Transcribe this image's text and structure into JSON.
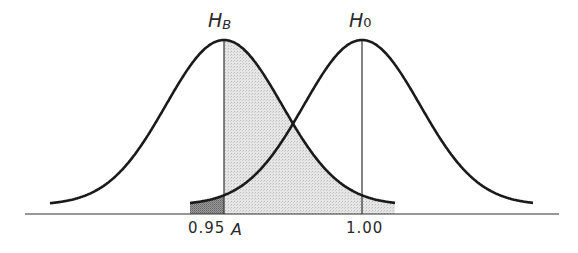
{
  "figure": {
    "labels": {
      "hb_main": "H",
      "hb_sub": "B",
      "h0_main": "H",
      "h0_sub": "0",
      "tick_left": "0.95",
      "tick_a": "A",
      "tick_right": "1.00"
    },
    "colors": {
      "stroke": "#1a1a1a",
      "light_shade": "#dcdcdc",
      "dark_shade": "#8a8a8a",
      "axis": "#333333"
    }
  },
  "chart_data": {
    "type": "diagram",
    "curves": [
      {
        "name": "H_B",
        "center_px": 224,
        "left_tail_px": 50,
        "right_tail_px": 395
      },
      {
        "name": "H_0",
        "center_px": 362,
        "left_tail_px": 190,
        "right_tail_px": 533
      }
    ],
    "vertical_lines": [
      {
        "label": "A",
        "x_px": 224
      },
      {
        "label": "1.00",
        "x_px": 362
      }
    ],
    "shaded_regions": [
      {
        "name": "light",
        "under": "H_B",
        "from_px": 224,
        "to_px": 395
      },
      {
        "name": "dark",
        "under": "H_0",
        "from_px": 190,
        "to_px": 224
      }
    ],
    "axis_ticks": [
      "0.95",
      "A",
      "1.00"
    ],
    "baseline": {
      "x_from": 25,
      "x_to": 559,
      "y": 214
    },
    "peak_y": 40,
    "sigma_px": 58
  }
}
